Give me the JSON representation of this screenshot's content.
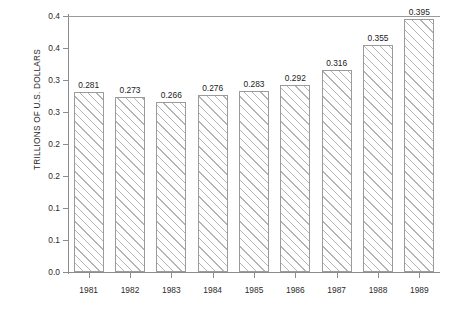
{
  "figure": {
    "cropped_top_text": "",
    "ylabel": "TRILLIONS OF U.S. DOLLARS"
  },
  "chart_data": {
    "type": "bar",
    "title": "",
    "xlabel": "",
    "ylabel": "TRILLIONS OF U.S. DOLLARS",
    "categories": [
      "1981",
      "1982",
      "1983",
      "1984",
      "1985",
      "1986",
      "1987",
      "1988",
      "1989"
    ],
    "values": [
      0.281,
      0.273,
      0.266,
      0.276,
      0.283,
      0.292,
      0.316,
      0.355,
      0.395
    ],
    "value_labels": [
      "0.281",
      "0.273",
      "0.266",
      "0.276",
      "0.283",
      "0.292",
      "0.316",
      "0.355",
      "0.395"
    ],
    "ylim": [
      0.0,
      0.4
    ],
    "ytick_values": [
      0.0,
      0.05,
      0.1,
      0.15,
      0.2,
      0.25,
      0.3,
      0.35,
      0.4
    ],
    "ytick_labels": [
      "0.0",
      "0.1",
      "0.1",
      "0.2",
      "0.2",
      "0.3",
      "0.3",
      "0.4",
      "0.4"
    ],
    "grid": false,
    "legend": null,
    "bar_fill": "diagonal-hatch",
    "bar_edge_color": "#9b9b9b",
    "text_color": "#222222"
  }
}
